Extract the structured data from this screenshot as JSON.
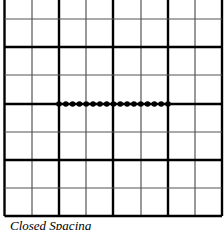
{
  "figure": {
    "caption": "Closed Spacing",
    "grid": {
      "columns": 8,
      "rows_visible": 8,
      "major_every": 2,
      "line_color": "#000000",
      "minor_line_color": "#555555",
      "x_lines": [
        4.5,
        32,
        59,
        86,
        113,
        141,
        168,
        195,
        222
      ],
      "y_lines": [
        -9,
        19,
        47,
        75,
        104,
        132,
        160,
        188,
        216
      ]
    },
    "dot_row": {
      "y": 104,
      "x_start": 59,
      "x_end": 168,
      "count": 17,
      "dot_color": "#000000"
    }
  }
}
